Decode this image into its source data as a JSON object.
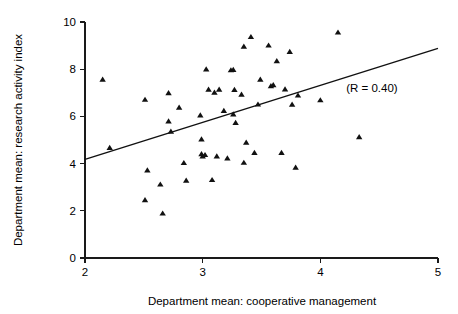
{
  "chart_data": {
    "type": "scatter",
    "title": "",
    "xlabel": "Department mean: cooperative management",
    "ylabel": "Department mean: research activity index",
    "xlim": [
      2,
      5
    ],
    "ylim": [
      0,
      10
    ],
    "xticks": [
      2,
      3,
      4,
      5
    ],
    "yticks": [
      0,
      2,
      4,
      6,
      8,
      10
    ],
    "xtick_labels": [
      "2",
      "3",
      "4",
      "5"
    ],
    "ytick_labels": [
      "0",
      "2",
      "4",
      "6",
      "8",
      "10"
    ],
    "grid": false,
    "legend": false,
    "marker": "triangle-up",
    "marker_color": "#111111",
    "annotations": [
      {
        "text": "(R = 0.40)",
        "x": 4.22,
        "y": 7.05
      }
    ],
    "correlation_r": 0.4,
    "series": [
      {
        "name": "Departments",
        "points": [
          [
            2.15,
            7.55
          ],
          [
            2.21,
            4.66
          ],
          [
            2.51,
            6.7
          ],
          [
            2.53,
            3.71
          ],
          [
            2.51,
            2.45
          ],
          [
            2.64,
            3.11
          ],
          [
            2.66,
            1.88
          ],
          [
            2.71,
            6.98
          ],
          [
            2.71,
            5.78
          ],
          [
            2.73,
            5.35
          ],
          [
            2.8,
            6.37
          ],
          [
            2.84,
            4.02
          ],
          [
            2.86,
            3.27
          ],
          [
            2.98,
            6.04
          ],
          [
            2.99,
            5.02
          ],
          [
            2.99,
            4.4
          ],
          [
            3.0,
            4.3
          ],
          [
            3.02,
            4.36
          ],
          [
            3.03,
            7.99
          ],
          [
            3.05,
            7.13
          ],
          [
            3.08,
            3.3
          ],
          [
            3.1,
            7.0
          ],
          [
            3.12,
            4.3
          ],
          [
            3.14,
            7.13
          ],
          [
            3.18,
            6.23
          ],
          [
            3.21,
            4.22
          ],
          [
            3.24,
            7.95
          ],
          [
            3.26,
            7.97
          ],
          [
            3.26,
            6.08
          ],
          [
            3.27,
            7.12
          ],
          [
            3.28,
            5.72
          ],
          [
            3.33,
            6.92
          ],
          [
            3.35,
            8.95
          ],
          [
            3.35,
            4.03
          ],
          [
            3.37,
            4.88
          ],
          [
            3.41,
            9.36
          ],
          [
            3.44,
            4.45
          ],
          [
            3.47,
            6.5
          ],
          [
            3.49,
            7.55
          ],
          [
            3.56,
            9.0
          ],
          [
            3.58,
            7.28
          ],
          [
            3.6,
            7.32
          ],
          [
            3.63,
            8.34
          ],
          [
            3.67,
            4.45
          ],
          [
            3.7,
            7.14
          ],
          [
            3.74,
            8.73
          ],
          [
            3.76,
            6.49
          ],
          [
            3.79,
            3.82
          ],
          [
            3.81,
            6.88
          ],
          [
            4.0,
            6.68
          ],
          [
            4.15,
            9.55
          ],
          [
            4.33,
            5.12
          ]
        ]
      }
    ],
    "fit_line": {
      "name": "regression-line",
      "x_start": 2.0,
      "y_start": 4.18,
      "x_end": 5.0,
      "y_end": 8.88
    }
  }
}
